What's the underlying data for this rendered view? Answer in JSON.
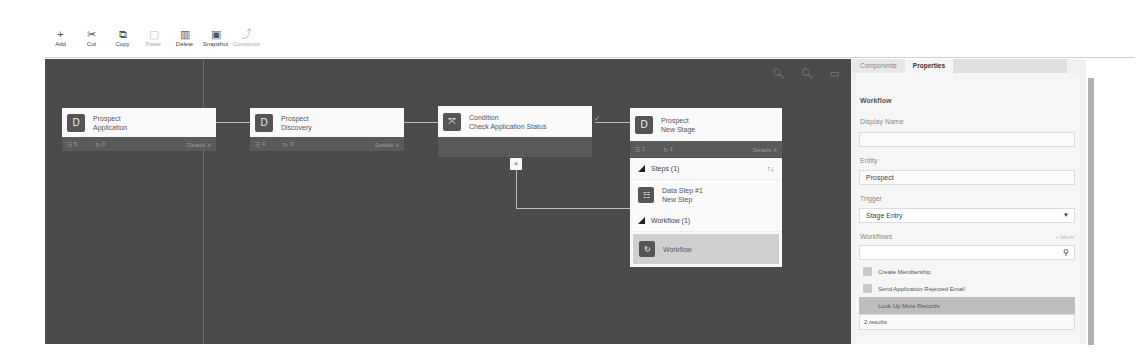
{
  "toolbar": {
    "buttons": [
      {
        "label": "Add",
        "icon": "plus-icon",
        "glyph": "+",
        "enabled": true
      },
      {
        "label": "Cut",
        "icon": "scissors-icon",
        "glyph": "✂",
        "enabled": true
      },
      {
        "label": "Copy",
        "icon": "copy-icon",
        "glyph": "⧉",
        "enabled": true
      },
      {
        "label": "Paste",
        "icon": "paste-icon",
        "glyph": "📋",
        "enabled": false
      },
      {
        "label": "Delete",
        "icon": "trash-icon",
        "glyph": "🗑",
        "enabled": true
      },
      {
        "label": "Snapshot",
        "icon": "snapshot-icon",
        "glyph": "▣",
        "enabled": true
      },
      {
        "label": "Connector",
        "icon": "connector-icon",
        "glyph": "⤴",
        "enabled": false
      }
    ]
  },
  "canvas": {
    "tools": {
      "zoom_out": "−",
      "zoom_in": "+",
      "fit": "▭"
    },
    "nodes": [
      {
        "title": "Prospect",
        "subtitle": "Application",
        "icon_glyph": "D",
        "steps": "5",
        "workflows": "0",
        "details_label": "Details ∨"
      },
      {
        "title": "Prospect",
        "subtitle": "Discovery",
        "icon_glyph": "D",
        "steps": "4",
        "workflows": "0",
        "details_label": "Details ∨"
      },
      {
        "title": "Condition",
        "subtitle": "Check Application Status",
        "icon_glyph": "⤧"
      },
      {
        "title": "Prospect",
        "subtitle": "New Stage",
        "icon_glyph": "D",
        "steps": "1",
        "workflows": "1",
        "details_label": "Details ∧"
      }
    ],
    "condition_true_mark": "✓",
    "condition_false_mark": "×",
    "expanded": {
      "steps_header": "Steps (1)",
      "sort_glyph": "↑↓",
      "step_title": "Data Step #1",
      "step_subtitle": "New Step",
      "workflow_header": "Workflow (1)",
      "workflow_item": "Workflow"
    }
  },
  "sidepanel": {
    "tabs": [
      "Components",
      "Properties"
    ],
    "active_tab": "Properties",
    "section_title": "Workflow",
    "display_name_label": "Display Name",
    "display_name_value": "",
    "entity_label": "Entity",
    "entity_value": "Prospect",
    "trigger_label": "Trigger",
    "trigger_value": "Stage Entry",
    "workflows_label": "Workflows",
    "more_label": "+ More",
    "search_value": "",
    "workflow_options": [
      "Create Membership",
      "Send Application Rejected Email",
      "Look Up More Records"
    ],
    "results_text": "2 results"
  }
}
